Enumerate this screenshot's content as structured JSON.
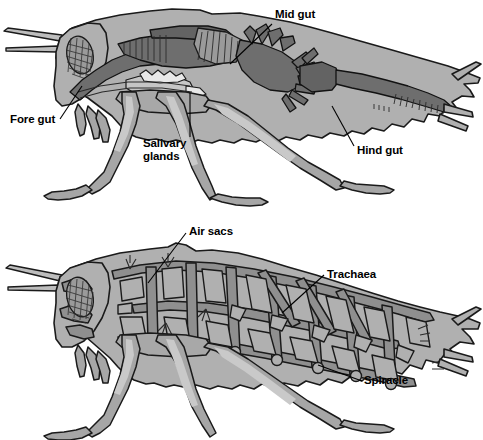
{
  "figure": {
    "panels": [
      {
        "id": "digestive",
        "name": "Insect digestive system",
        "labels": [
          {
            "id": "mid-gut",
            "text": "Mid gut",
            "x": 275,
            "y": 14,
            "align": "left"
          },
          {
            "id": "fore-gut",
            "text": "Fore gut",
            "x": 10,
            "y": 118,
            "align": "left"
          },
          {
            "id": "salivary",
            "text": "Salivary\nglands",
            "x": 143,
            "y": 140,
            "align": "left"
          },
          {
            "id": "hind-gut",
            "text": "Hind gut",
            "x": 357,
            "y": 147,
            "align": "left"
          }
        ]
      },
      {
        "id": "respiratory",
        "name": "Insect respiratory system",
        "labels": [
          {
            "id": "air-sacs",
            "text": "Air sacs",
            "x": 189,
            "y": 213,
            "align": "left"
          },
          {
            "id": "trachaea",
            "text": "Trachaea",
            "x": 327,
            "y": 251,
            "align": "left"
          },
          {
            "id": "spiracle",
            "text": "Spiracle",
            "x": 364,
            "y": 371,
            "align": "left"
          }
        ]
      }
    ]
  },
  "palette": {
    "background": "#ffffff",
    "body_gray": "#b0b0b0",
    "organ_mid_gray": "#9a9a9a",
    "organ_dark_gray": "#6e6e6e",
    "trachea_gray": "#8f8f8f",
    "outline_black": "#1a1a1a",
    "label_text": "#000000"
  }
}
